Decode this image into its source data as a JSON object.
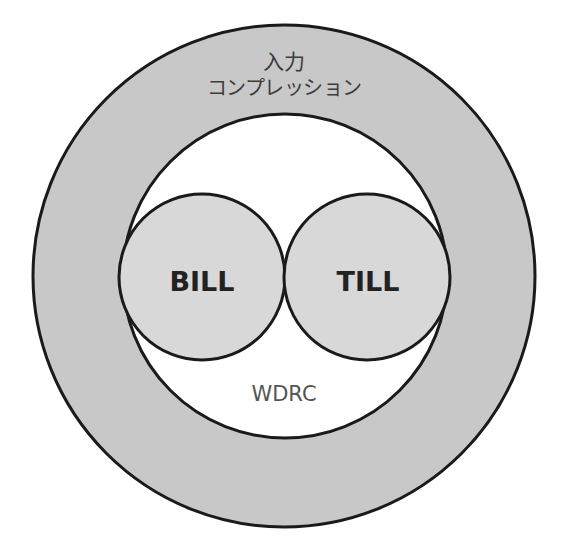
{
  "diagram": {
    "type": "nested-circles",
    "outer_ring": {
      "label_line1": "入力",
      "label_line2": "コンプレッション",
      "fill": "#c8c8c8",
      "stroke": "#1a1a1a"
    },
    "inner_circle": {
      "label": "WDRC",
      "fill": "#ffffff",
      "stroke": "#1a1a1a"
    },
    "left_circle": {
      "label": "BILL",
      "fill": "#d8d8d8",
      "stroke": "#1a1a1a"
    },
    "right_circle": {
      "label": "TILL",
      "fill": "#d8d8d8",
      "stroke": "#1a1a1a"
    }
  }
}
